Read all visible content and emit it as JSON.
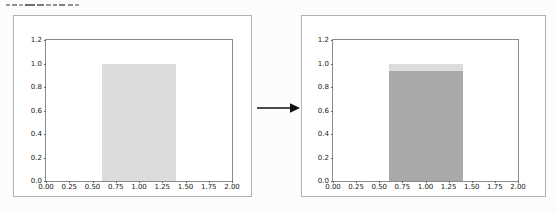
{
  "page": {
    "background": "#fcfcfc",
    "box_border_color": "#b2b2b2",
    "axes_border_color": "#8a8a8a"
  },
  "clipped_caption": {
    "note": "line of text cut off at the top edge of the screenshot, only glyph bottoms visible",
    "marks": [
      {
        "x": 0,
        "w": 4,
        "color": "#9a9a9a"
      },
      {
        "x": 6,
        "w": 5,
        "color": "#8f8f8f"
      },
      {
        "x": 13,
        "w": 4,
        "color": "#a5a5a5"
      },
      {
        "x": 19,
        "w": 10,
        "color": "#6f6f6f"
      },
      {
        "x": 31,
        "w": 7,
        "color": "#7a7a7a"
      },
      {
        "x": 40,
        "w": 5,
        "color": "#9a9a9a"
      },
      {
        "x": 47,
        "w": 4,
        "color": "#8f8f8f"
      },
      {
        "x": 53,
        "w": 6,
        "color": "#7f7f7f"
      },
      {
        "x": 62,
        "w": 5,
        "color": "#909090"
      },
      {
        "x": 69,
        "w": 4,
        "color": "#a0a0a0"
      }
    ]
  },
  "arrow": {
    "direction": "right",
    "color": "#111111"
  },
  "chart_data": [
    {
      "type": "bar",
      "title": "",
      "xlabel": "",
      "ylabel": "",
      "xlim": [
        0,
        2.0
      ],
      "ylim": [
        0,
        1.2
      ],
      "xticks": [
        "0.00",
        "0.25",
        "0.50",
        "0.75",
        "1.00",
        "1.25",
        "1.50",
        "1.75",
        "2.00"
      ],
      "yticks": [
        "0.0",
        "0.2",
        "0.4",
        "0.6",
        "0.8",
        "1.0",
        "1.2"
      ],
      "grid": false,
      "legend": false,
      "bars": [
        {
          "x0": 0.6,
          "x1": 1.4,
          "segments": [
            {
              "from": 0,
              "to": 1.0,
              "color": "#dcdcdc"
            }
          ]
        }
      ]
    },
    {
      "type": "bar",
      "title": "",
      "xlabel": "",
      "ylabel": "",
      "xlim": [
        0,
        2.0
      ],
      "ylim": [
        0,
        1.2
      ],
      "xticks": [
        "0.00",
        "0.25",
        "0.50",
        "0.75",
        "1.00",
        "1.25",
        "1.50",
        "1.75",
        "2.00"
      ],
      "yticks": [
        "0.0",
        "0.2",
        "0.4",
        "0.6",
        "0.8",
        "1.0",
        "1.2"
      ],
      "grid": false,
      "legend": false,
      "bars": [
        {
          "x0": 0.6,
          "x1": 1.4,
          "segments": [
            {
              "from": 0,
              "to": 0.94,
              "color": "#a9a9a9"
            },
            {
              "from": 0.94,
              "to": 1.0,
              "color": "#dcdcdc"
            }
          ]
        }
      ]
    }
  ]
}
